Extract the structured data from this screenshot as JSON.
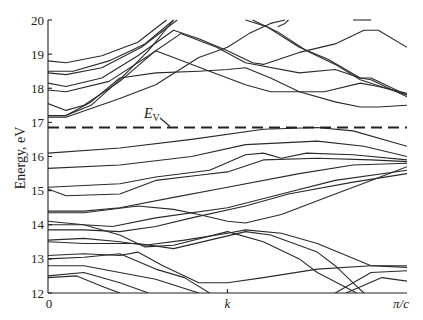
{
  "chart_data": {
    "type": "line",
    "title": "",
    "xlabel": "k",
    "ylabel": "Energy, eV",
    "ylim": [
      12,
      20
    ],
    "xlim": [
      0,
      1
    ],
    "x_tick_labels": [
      "0",
      "k",
      "π/c"
    ],
    "x_tick_positions": [
      0,
      0.5,
      1
    ],
    "y_ticks": [
      12,
      13,
      14,
      15,
      16,
      17,
      18,
      19,
      20
    ],
    "grid": false,
    "legend": null,
    "annotations": [
      {
        "text": "E",
        "subscript": "V",
        "x": 0.27,
        "y": 17.1,
        "points_to": {
          "x": 0.34,
          "y": 16.85
        }
      }
    ],
    "reference_lines": [
      {
        "name": "E_V",
        "y": 16.85,
        "style": "dashed"
      }
    ],
    "series": [
      {
        "name": "cb1",
        "points": [
          [
            0,
            18.8
          ],
          [
            0.05,
            18.75
          ],
          [
            0.15,
            18.95
          ],
          [
            0.25,
            19.35
          ],
          [
            0.33,
            20
          ]
        ]
      },
      {
        "name": "cb2",
        "points": [
          [
            0,
            18.5
          ],
          [
            0.07,
            18.5
          ],
          [
            0.17,
            18.8
          ],
          [
            0.27,
            19.3
          ],
          [
            0.35,
            20
          ]
        ]
      },
      {
        "name": "cb3",
        "points": [
          [
            0,
            18.45
          ],
          [
            0.05,
            18.4
          ],
          [
            0.15,
            18.6
          ],
          [
            0.26,
            19.2
          ],
          [
            0.36,
            20
          ]
        ]
      },
      {
        "name": "cb4",
        "points": [
          [
            0,
            18.15
          ],
          [
            0.05,
            18.05
          ],
          [
            0.15,
            18.3
          ],
          [
            0.25,
            18.95
          ],
          [
            0.35,
            19.7
          ],
          [
            0.42,
            19.45
          ],
          [
            0.5,
            19.1
          ],
          [
            0.57,
            18.75
          ],
          [
            0.6,
            18.7
          ],
          [
            0.7,
            19.05
          ],
          [
            0.8,
            19.3
          ],
          [
            0.88,
            19.7
          ],
          [
            0.92,
            19.7
          ],
          [
            1,
            19.2
          ]
        ]
      },
      {
        "name": "cb5",
        "points": [
          [
            0,
            17.95
          ],
          [
            0.05,
            17.9
          ],
          [
            0.17,
            18.2
          ],
          [
            0.28,
            18.95
          ],
          [
            0.37,
            19.6
          ],
          [
            0.47,
            19.2
          ],
          [
            0.55,
            18.75
          ],
          [
            0.7,
            18.45
          ],
          [
            0.8,
            18.55
          ],
          [
            0.87,
            18.3
          ],
          [
            0.9,
            18.3
          ],
          [
            1,
            17.8
          ]
        ]
      },
      {
        "name": "cb6",
        "points": [
          [
            0,
            17.55
          ],
          [
            0.05,
            17.35
          ],
          [
            0.1,
            17.5
          ],
          [
            0.2,
            18.2
          ],
          [
            0.3,
            19.1
          ],
          [
            0.35,
            18.9
          ],
          [
            0.45,
            18.5
          ],
          [
            0.55,
            18.1
          ],
          [
            0.62,
            17.9
          ],
          [
            0.7,
            17.9
          ],
          [
            0.77,
            17.9
          ],
          [
            0.87,
            18.15
          ],
          [
            0.92,
            18.05
          ],
          [
            1,
            17.85
          ]
        ]
      },
      {
        "name": "cb7",
        "points": [
          [
            0,
            17.2
          ],
          [
            0.05,
            17.2
          ],
          [
            0.12,
            17.6
          ],
          [
            0.2,
            18.3
          ],
          [
            0.3,
            18.45
          ],
          [
            0.42,
            18.5
          ],
          [
            0.5,
            18.55
          ],
          [
            0.55,
            18.6
          ],
          [
            0.62,
            18.3
          ],
          [
            0.7,
            17.9
          ],
          [
            0.8,
            17.6
          ],
          [
            0.87,
            17.45
          ],
          [
            0.92,
            17.45
          ],
          [
            1,
            17.5
          ]
        ]
      },
      {
        "name": "cb8",
        "points": [
          [
            0,
            17.15
          ],
          [
            0.05,
            17.15
          ],
          [
            0.2,
            17.7
          ],
          [
            0.3,
            18.1
          ],
          [
            0.42,
            18.9
          ],
          [
            0.5,
            19.2
          ],
          [
            0.56,
            19.6
          ],
          [
            0.62,
            19.9
          ],
          [
            0.66,
            20
          ]
        ]
      },
      {
        "name": "cb9",
        "points": [
          [
            0,
            17.2
          ],
          [
            0.05,
            17.2
          ],
          [
            0.12,
            17.5
          ],
          [
            0.2,
            18.25
          ],
          [
            0.28,
            19.1
          ],
          [
            0.35,
            20
          ]
        ]
      },
      {
        "name": "cb10",
        "points": [
          [
            0.55,
            20
          ],
          [
            0.61,
            19.8
          ],
          [
            0.7,
            19.2
          ],
          [
            0.78,
            18.85
          ],
          [
            0.87,
            18.3
          ],
          [
            0.9,
            18.25
          ],
          [
            1,
            17.75
          ]
        ]
      },
      {
        "name": "cb11",
        "points": [
          [
            0.57,
            20
          ],
          [
            0.64,
            19.65
          ],
          [
            0.72,
            19.1
          ],
          [
            0.8,
            18.7
          ],
          [
            0.87,
            18.25
          ],
          [
            1,
            17.8
          ]
        ]
      },
      {
        "name": "cb12",
        "points": [
          [
            0.64,
            19.8
          ],
          [
            0.66,
            19.9
          ],
          [
            0.67,
            20
          ]
        ]
      },
      {
        "name": "cb13",
        "points": [
          [
            0.85,
            20
          ],
          [
            0.9,
            20
          ]
        ]
      },
      {
        "name": "vb1",
        "points": [
          [
            0,
            16.1
          ],
          [
            0.2,
            16.25
          ],
          [
            0.4,
            16.5
          ],
          [
            0.6,
            16.8
          ],
          [
            0.75,
            16.85
          ],
          [
            0.85,
            16.75
          ],
          [
            1,
            16.3
          ]
        ]
      },
      {
        "name": "vb2",
        "points": [
          [
            0,
            15.65
          ],
          [
            0.2,
            15.75
          ],
          [
            0.4,
            16.0
          ],
          [
            0.55,
            16.35
          ],
          [
            0.75,
            16.45
          ],
          [
            0.88,
            16.3
          ],
          [
            1,
            16.0
          ]
        ]
      },
      {
        "name": "vb3",
        "points": [
          [
            0,
            15.1
          ],
          [
            0.2,
            15.2
          ],
          [
            0.3,
            15.4
          ],
          [
            0.45,
            15.6
          ],
          [
            0.55,
            16.05
          ],
          [
            0.6,
            16.1
          ],
          [
            0.65,
            15.95
          ],
          [
            0.72,
            16.1
          ],
          [
            0.85,
            16.05
          ],
          [
            1,
            15.9
          ]
        ]
      },
      {
        "name": "vb4",
        "points": [
          [
            0,
            15.05
          ],
          [
            0.05,
            14.85
          ],
          [
            0.2,
            14.9
          ],
          [
            0.3,
            15.3
          ],
          [
            0.42,
            15.45
          ],
          [
            0.5,
            15.55
          ],
          [
            0.6,
            15.9
          ],
          [
            0.75,
            15.95
          ],
          [
            0.9,
            15.9
          ],
          [
            1,
            15.85
          ]
        ]
      },
      {
        "name": "vb5",
        "points": [
          [
            0,
            14.4
          ],
          [
            0.1,
            14.4
          ],
          [
            0.2,
            14.5
          ],
          [
            0.35,
            14.8
          ],
          [
            0.5,
            15.1
          ],
          [
            0.7,
            15.5
          ],
          [
            0.85,
            15.75
          ],
          [
            1,
            15.8
          ]
        ]
      },
      {
        "name": "vb6",
        "points": [
          [
            0,
            14.35
          ],
          [
            0.1,
            14.35
          ],
          [
            0.25,
            14.55
          ],
          [
            0.35,
            14.45
          ],
          [
            0.42,
            14.3
          ],
          [
            0.5,
            14.1
          ],
          [
            0.55,
            14.05
          ],
          [
            0.65,
            14.3
          ],
          [
            0.8,
            14.9
          ],
          [
            0.9,
            15.3
          ],
          [
            1,
            15.7
          ]
        ]
      },
      {
        "name": "vb7",
        "points": [
          [
            0,
            14.1
          ],
          [
            0.1,
            14.0
          ],
          [
            0.18,
            13.95
          ],
          [
            0.3,
            14.2
          ],
          [
            0.5,
            14.5
          ],
          [
            0.65,
            14.9
          ],
          [
            0.8,
            15.3
          ],
          [
            1,
            15.6
          ]
        ]
      },
      {
        "name": "vb8",
        "points": [
          [
            0,
            13.85
          ],
          [
            0.1,
            13.85
          ],
          [
            0.2,
            13.8
          ],
          [
            0.3,
            13.95
          ],
          [
            0.4,
            14.2
          ],
          [
            0.55,
            14.55
          ],
          [
            0.67,
            14.9
          ],
          [
            0.85,
            15.25
          ],
          [
            1,
            15.5
          ]
        ]
      },
      {
        "name": "vb9",
        "points": [
          [
            0,
            14.0
          ],
          [
            0.1,
            14.0
          ],
          [
            0.2,
            13.7
          ],
          [
            0.27,
            13.35
          ],
          [
            0.35,
            13.4
          ],
          [
            0.5,
            13.8
          ],
          [
            0.6,
            13.5
          ],
          [
            0.7,
            13.0
          ],
          [
            0.75,
            12.6
          ],
          [
            0.86,
            12.0
          ]
        ]
      },
      {
        "name": "vb10",
        "points": [
          [
            0,
            13.55
          ],
          [
            0.1,
            13.6
          ],
          [
            0.2,
            13.5
          ],
          [
            0.27,
            13.4
          ],
          [
            0.38,
            13.55
          ],
          [
            0.5,
            13.75
          ],
          [
            0.55,
            13.85
          ],
          [
            0.65,
            13.75
          ],
          [
            0.75,
            13.45
          ],
          [
            0.9,
            12.8
          ],
          [
            1,
            12.75
          ]
        ]
      },
      {
        "name": "vb11",
        "points": [
          [
            0,
            13.5
          ],
          [
            0.1,
            13.45
          ],
          [
            0.25,
            13.45
          ],
          [
            0.35,
            13.3
          ],
          [
            0.45,
            13.55
          ],
          [
            0.55,
            13.8
          ],
          [
            0.62,
            13.7
          ],
          [
            0.75,
            13.2
          ],
          [
            0.8,
            12.8
          ],
          [
            0.85,
            12.3
          ],
          [
            0.88,
            12.0
          ]
        ]
      },
      {
        "name": "vb12",
        "points": [
          [
            0,
            13.1
          ],
          [
            0.1,
            13.15
          ],
          [
            0.2,
            13.1
          ],
          [
            0.25,
            13.2
          ],
          [
            0.32,
            12.8
          ],
          [
            0.42,
            12.3
          ],
          [
            0.5,
            12.3
          ],
          [
            0.6,
            12.45
          ],
          [
            0.75,
            12.7
          ],
          [
            0.9,
            12.8
          ],
          [
            1,
            12.8
          ]
        ]
      },
      {
        "name": "vb13",
        "points": [
          [
            0,
            13.0
          ],
          [
            0.1,
            13.05
          ],
          [
            0.2,
            13.15
          ],
          [
            0.3,
            12.7
          ],
          [
            0.38,
            12.45
          ],
          [
            0.45,
            12.0
          ]
        ]
      },
      {
        "name": "vb14",
        "points": [
          [
            0,
            12.8
          ],
          [
            0.1,
            12.8
          ],
          [
            0.2,
            12.6
          ],
          [
            0.3,
            12.4
          ],
          [
            0.42,
            12.0
          ]
        ]
      },
      {
        "name": "vb15",
        "points": [
          [
            0,
            12.5
          ],
          [
            0.1,
            12.6
          ],
          [
            0.2,
            12.3
          ],
          [
            0.28,
            12.0
          ]
        ]
      },
      {
        "name": "vb16",
        "points": [
          [
            0,
            12.45
          ],
          [
            0.08,
            12.5
          ],
          [
            0.15,
            12.2
          ],
          [
            0.2,
            12.0
          ]
        ]
      },
      {
        "name": "vb17",
        "points": [
          [
            0.83,
            12.0
          ],
          [
            0.93,
            12.45
          ],
          [
            1,
            12.35
          ]
        ]
      },
      {
        "name": "vb18",
        "points": [
          [
            0.8,
            12.0
          ],
          [
            0.9,
            12.6
          ],
          [
            1,
            12.65
          ]
        ]
      }
    ]
  },
  "labels": {
    "y_axis_title": "Energy, eV",
    "ev_main": "E",
    "ev_sub": "V",
    "x_tick_0": "0",
    "x_tick_mid": "k",
    "x_tick_end": "π/c"
  }
}
